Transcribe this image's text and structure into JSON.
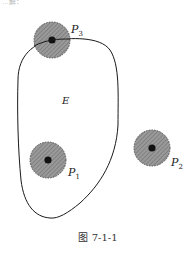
{
  "cropped_top_text": "…解：",
  "region": {
    "label": "E"
  },
  "points": [
    {
      "name": "P",
      "sub": "3",
      "cx": 52,
      "cy": 40,
      "r": 18,
      "lx": 70,
      "ly": 33
    },
    {
      "name": "P",
      "sub": "1",
      "cx": 48,
      "cy": 160,
      "r": 18,
      "lx": 68,
      "ly": 177
    },
    {
      "name": "P",
      "sub": "2",
      "cx": 152,
      "cy": 148,
      "r": 18,
      "lx": 171,
      "ly": 167
    }
  ],
  "caption": "图 7-1-1",
  "colors": {
    "disk_fill": "#8a8a8a",
    "disk_edge": "#555555",
    "center_dot": "#111111",
    "curve": "#1a1a1a"
  }
}
